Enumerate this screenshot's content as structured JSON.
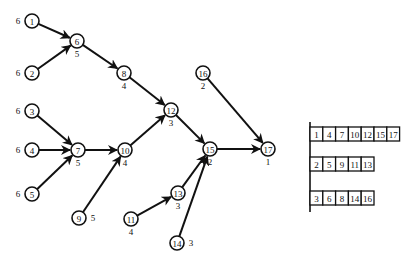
{
  "diagram": {
    "nodes": [
      {
        "id": "1",
        "weight": "6",
        "weight_side": "left"
      },
      {
        "id": "2",
        "weight": "6",
        "weight_side": "left"
      },
      {
        "id": "3",
        "weight": "6",
        "weight_side": "left"
      },
      {
        "id": "4",
        "weight": "6",
        "weight_side": "left"
      },
      {
        "id": "5",
        "weight": "6",
        "weight_side": "left"
      },
      {
        "id": "6",
        "weight": "5",
        "weight_side": "below"
      },
      {
        "id": "7",
        "weight": "5",
        "weight_side": "below"
      },
      {
        "id": "8",
        "weight": "4",
        "weight_side": "below"
      },
      {
        "id": "9",
        "weight": "5",
        "weight_side": "right"
      },
      {
        "id": "10",
        "weight": "4",
        "weight_side": "below"
      },
      {
        "id": "11",
        "weight": "4",
        "weight_side": "below"
      },
      {
        "id": "12",
        "weight": "3",
        "weight_side": "below"
      },
      {
        "id": "13",
        "weight": "3",
        "weight_side": "below"
      },
      {
        "id": "14",
        "weight": "3",
        "weight_side": "right"
      },
      {
        "id": "15",
        "weight": "2",
        "weight_side": "below"
      },
      {
        "id": "16",
        "weight": "2",
        "weight_side": "below"
      },
      {
        "id": "17",
        "weight": "1",
        "weight_side": "below"
      }
    ],
    "edges": [
      [
        "1",
        "6"
      ],
      [
        "2",
        "6"
      ],
      [
        "6",
        "8"
      ],
      [
        "8",
        "12"
      ],
      [
        "3",
        "7"
      ],
      [
        "4",
        "7"
      ],
      [
        "5",
        "7"
      ],
      [
        "7",
        "10"
      ],
      [
        "9",
        "10"
      ],
      [
        "10",
        "12"
      ],
      [
        "12",
        "15"
      ],
      [
        "11",
        "13"
      ],
      [
        "13",
        "15"
      ],
      [
        "14",
        "15"
      ],
      [
        "15",
        "17"
      ],
      [
        "16",
        "17"
      ]
    ]
  },
  "partition_table": {
    "rows": [
      [
        "1",
        "4",
        "7",
        "10",
        "12",
        "15",
        "17"
      ],
      [
        "2",
        "5",
        "9",
        "11",
        "13"
      ],
      [
        "3",
        "6",
        "8",
        "14",
        "16"
      ]
    ]
  }
}
